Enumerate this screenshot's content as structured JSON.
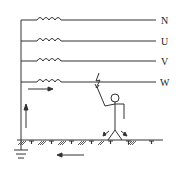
{
  "diagram": {
    "conductors": [
      {
        "label": "N",
        "y": 20
      },
      {
        "label": "U",
        "y": 41
      },
      {
        "label": "V",
        "y": 61
      },
      {
        "label": "W",
        "y": 82
      }
    ],
    "colors": {
      "line": "#333333",
      "background": "#ffffff"
    }
  }
}
